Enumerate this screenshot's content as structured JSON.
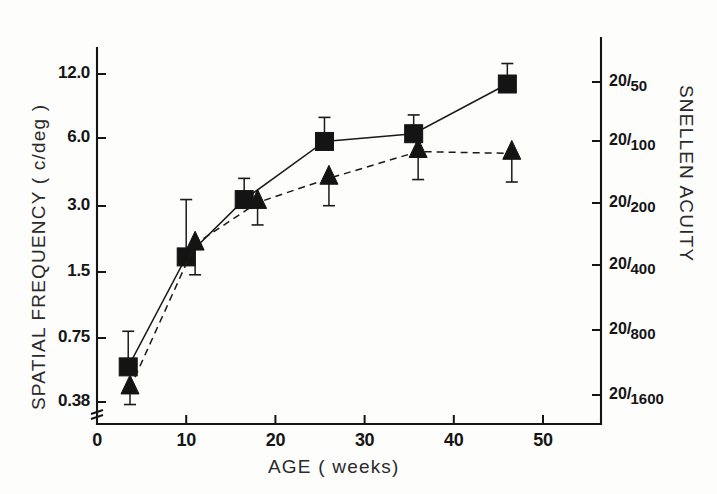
{
  "chart_data": {
    "type": "line",
    "title": "",
    "xlabel": "AGE  ( weeks)",
    "ylabel": "SPATIAL  FREQUENCY   ( c/deg )",
    "ylabel_right": "SNELLEN  ACUITY",
    "xlim": [
      0,
      56.5
    ],
    "ylim": [
      0.3,
      19.0
    ],
    "yscale": "log2",
    "grid": false,
    "legend": "none",
    "xticks": [
      0,
      10,
      20,
      30,
      40,
      50
    ],
    "xticklabels": [
      "0",
      "10",
      "20",
      "30",
      "40",
      "50"
    ],
    "yticks": [
      12.0,
      6.0,
      3.0,
      1.5,
      0.75,
      0.38
    ],
    "yticklabels": [
      "12.0",
      "6.0",
      "3.0",
      "1.5",
      "0.75",
      "0.38"
    ],
    "y2ticks": [
      9.0,
      4.5,
      2.25,
      1.125,
      0.5625,
      0.281
    ],
    "y2ticklabels": [
      {
        "num": "20",
        "slash": "/",
        "den": "50"
      },
      {
        "num": "20",
        "slash": "/",
        "den": "100"
      },
      {
        "num": "20",
        "slash": "/",
        "den": "200"
      },
      {
        "num": "20",
        "slash": "/",
        "den": "400"
      },
      {
        "num": "20",
        "slash": "/",
        "den": "800"
      },
      {
        "num": "20",
        "slash": "/",
        "den": "1600"
      }
    ],
    "axis_break": true,
    "series": [
      {
        "name": "squares-solid",
        "marker": "square",
        "linestyle": "solid",
        "x": [
          3.5,
          10.0,
          16.5,
          25.5,
          35.5,
          46.0
        ],
        "y": [
          0.55,
          1.75,
          3.2,
          5.9,
          6.4,
          10.8
        ],
        "yerr_upper": [
          0.8,
          3.2,
          4.0,
          7.6,
          7.8,
          13.4
        ],
        "yerr_lower": [
          0.55,
          1.75,
          3.2,
          5.9,
          6.4,
          10.8
        ]
      },
      {
        "name": "triangles-dashed",
        "marker": "triangle",
        "linestyle": "dashed",
        "x": [
          3.7,
          11.0,
          18.0,
          26.0,
          36.0,
          46.5
        ],
        "y": [
          0.44,
          2.0,
          3.1,
          4.0,
          5.3,
          5.2
        ],
        "yerr_upper": [
          0.44,
          2.0,
          3.1,
          4.0,
          5.3,
          5.2
        ],
        "yerr_lower": [
          0.37,
          1.45,
          2.45,
          3.0,
          3.95,
          3.85
        ]
      }
    ],
    "colors": {
      "marker": "#141414",
      "line": "#1a1a1a",
      "axis": "#151515",
      "background": "#fdfdfc"
    }
  }
}
